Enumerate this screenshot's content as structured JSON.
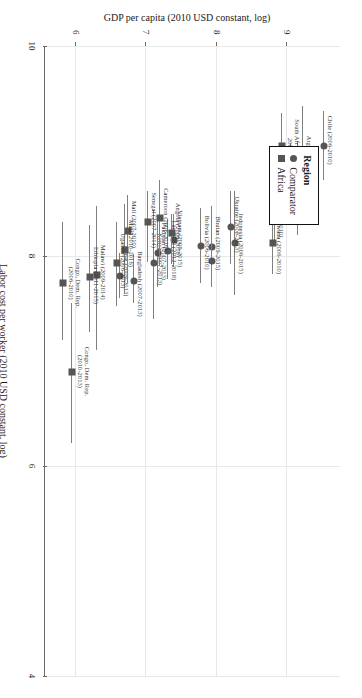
{
  "chart_data": {
    "type": "scatter",
    "title": "",
    "xlabel": "Labor cost per worker (2010 USD constant, log)",
    "ylabel": "GDP per capita (2010 USD constant, log)",
    "xlim": [
      4,
      10
    ],
    "ylim": [
      5.55,
      9.75
    ],
    "xticks": [
      10,
      8,
      6,
      4
    ],
    "yticks": [
      9,
      8,
      7,
      6
    ],
    "grid": true,
    "legend": {
      "title": "Region",
      "position": "upper-right",
      "entries": [
        {
          "label": "Comparator",
          "marker": "circle",
          "color": "#555555"
        },
        {
          "label": "Africa",
          "marker": "square",
          "color": "#555555"
        }
      ]
    },
    "series": [
      {
        "name": "Comparator",
        "marker": "circle",
        "points": [
          {
            "label": "Chile (2006-2010)",
            "x": 9.05,
            "y": 9.53,
            "xlo": 8.72,
            "xhi": 9.38
          },
          {
            "label": "Argentina (2006-2010)",
            "x": 8.86,
            "y": 9.22,
            "xlo": 8.35,
            "xhi": 9.43
          },
          {
            "label": "Brazil (2003-2009)",
            "x": 8.64,
            "y": 9.16,
            "xlo": 8.2,
            "xhi": 9.1
          },
          {
            "label": "Mexico (2006-2010)",
            "x": 8.76,
            "y": 9.06,
            "xlo": 8.45,
            "xhi": 9.08
          },
          {
            "label": "Botswana (2006-2010)",
            "x": 8.47,
            "y": 8.83,
            "xlo": 8.1,
            "xhi": 8.86
          },
          {
            "label": "Indonesia (2006-2015)",
            "x": 8.12,
            "y": 8.26,
            "xlo": 7.63,
            "xhi": 8.62
          },
          {
            "label": "Ukraine (2008-2013)",
            "x": 8.28,
            "y": 8.2,
            "xlo": 7.92,
            "xhi": 8.62
          },
          {
            "label": "Bhutan (2009-2015)",
            "x": 8.09,
            "y": 7.93,
            "xlo": 7.7,
            "xhi": 8.48
          },
          {
            "label": "Bhutan (2009-2015) b",
            "x": 7.95,
            "y": 7.93,
            "xlo": 7.7,
            "xhi": 8.48
          },
          {
            "label": "Bolivia (2006-2010)",
            "x": 8.1,
            "y": 7.78,
            "xlo": 7.74,
            "xhi": 8.46
          },
          {
            "label": "Vietnam (2009-2015)",
            "x": 8.15,
            "y": 7.39,
            "xlo": 7.9,
            "xhi": 8.4
          },
          {
            "label": "Lao PDR (2012-2018)",
            "x": 8.05,
            "y": 7.31,
            "xlo": 7.78,
            "xhi": 8.35
          },
          {
            "label": "Pakistan (2007-2013)",
            "x": 8.03,
            "y": 7.17,
            "xlo": 7.7,
            "xhi": 8.34
          },
          {
            "label": "Kenya (2007-2013)",
            "x": 7.93,
            "y": 7.11,
            "xlo": 7.4,
            "xhi": 8.44
          },
          {
            "label": "Bangladesh (2007-2013)",
            "x": 7.76,
            "y": 6.82,
            "xlo": 7.55,
            "xhi": 8.02
          },
          {
            "label": "Nepal (2009-2013)",
            "x": 7.81,
            "y": 6.63,
            "xlo": 7.6,
            "xhi": 8.03
          }
        ]
      },
      {
        "name": "Africa",
        "marker": "square",
        "points": [
          {
            "label": "South Africa (2003-2007)",
            "x": 9.05,
            "y": 8.93,
            "xlo": 8.8,
            "xhi": 9.36
          },
          {
            "label": "Botswana (2006-2010)",
            "x": 8.12,
            "y": 8.8,
            "xlo": 7.83,
            "xhi": 8.47
          },
          {
            "label": "Angola (2006-2010)",
            "x": 8.22,
            "y": 7.36,
            "xlo": 7.92,
            "xhi": 8.4
          },
          {
            "label": "Cameroon (2006-2016)",
            "x": 8.36,
            "y": 7.19,
            "xlo": 7.9,
            "xhi": 8.72
          },
          {
            "label": "Senegal (2007-2014)",
            "x": 8.32,
            "y": 7.03,
            "xlo": 7.94,
            "xhi": 8.62
          },
          {
            "label": "Mali (2007-2010)",
            "x": 8.24,
            "y": 6.74,
            "xlo": 7.74,
            "xhi": 8.58
          },
          {
            "label": "Mali (2010-2016)",
            "x": 8.06,
            "y": 6.7,
            "xlo": 7.64,
            "xhi": 8.5
          },
          {
            "label": "Uganda (2006-2013)",
            "x": 7.93,
            "y": 6.58,
            "xlo": 7.52,
            "xhi": 8.32
          },
          {
            "label": "Malawi (2009-2014)",
            "x": 7.82,
            "y": 6.3,
            "xlo": 7.1,
            "xhi": 8.48
          },
          {
            "label": "Ethiopia (2011-2015)",
            "x": 7.8,
            "y": 6.2,
            "xlo": 7.28,
            "xhi": 8.3
          },
          {
            "label": "Congo, Dem. Rep. (2010-2013)",
            "x": 6.9,
            "y": 5.95,
            "xlo": 6.22,
            "xhi": 7.55
          },
          {
            "label": "Congo, Dem. Rep. (2006-2010)",
            "x": 7.74,
            "y": 5.82,
            "xlo": 7.2,
            "xhi": 8.32
          }
        ]
      }
    ]
  },
  "axes": {
    "x_title": "Labor cost per worker (2010 USD constant, log)",
    "y_title": "GDP per capita (2010 USD constant, log)",
    "x_tick_labels": [
      "10",
      "8",
      "6",
      "4"
    ],
    "y_tick_labels": [
      "9",
      "8",
      "7",
      "6"
    ]
  },
  "legend": {
    "title": "Region",
    "comparator_label": "Comparator",
    "africa_label": "Africa"
  }
}
